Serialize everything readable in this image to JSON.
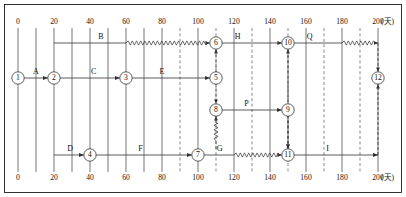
{
  "diagram": {
    "unit_label": "(天)",
    "axis": {
      "min": 0,
      "max": 200,
      "major_step": 20,
      "minor_step": 10,
      "major_ticks": [
        0,
        20,
        40,
        60,
        80,
        100,
        120,
        140,
        160,
        180,
        200
      ],
      "minor_dashed_ticks": [
        90,
        110,
        130,
        150,
        170,
        190
      ],
      "minor_solid_ticks": [
        10,
        30,
        50,
        70
      ],
      "top_tick_labels": [
        "0",
        "20",
        "40",
        "60",
        "80",
        "100",
        "120",
        "140",
        "160",
        "180",
        "200"
      ],
      "bottom_tick_labels": [
        "0",
        "20",
        "40",
        "60",
        "80",
        "100",
        "120",
        "140",
        "160",
        "180",
        "200"
      ]
    },
    "rows": {
      "r1": 43,
      "r2": 78,
      "r3": 110,
      "r4": 155
    },
    "nodes": [
      {
        "id": "1",
        "label": "1",
        "day": 0,
        "row": "r2"
      },
      {
        "id": "2",
        "label": "2",
        "day": 20,
        "row": "r2"
      },
      {
        "id": "3",
        "label": "3",
        "day": 60,
        "row": "r2"
      },
      {
        "id": "4",
        "label": "4",
        "day": 40,
        "row": "r4"
      },
      {
        "id": "5",
        "label": "5",
        "day": 110,
        "row": "r2"
      },
      {
        "id": "6",
        "label": "6",
        "day": 110,
        "row": "r1"
      },
      {
        "id": "7",
        "label": "7",
        "day": 100,
        "row": "r4"
      },
      {
        "id": "8",
        "label": "8",
        "day": 110,
        "row": "r3"
      },
      {
        "id": "9",
        "label": "9",
        "day": 150,
        "row": "r3"
      },
      {
        "id": "10",
        "label": "10",
        "day": 150,
        "row": "r1"
      },
      {
        "id": "11",
        "label": "11",
        "day": 150,
        "row": "r4"
      },
      {
        "id": "12",
        "label": "12",
        "day": 200,
        "row": "r2"
      }
    ],
    "activities": [
      {
        "name": "A",
        "from": "1",
        "to": "2",
        "row": "r2",
        "start": 0,
        "end": 20,
        "duration": 20,
        "float": 0,
        "label_day": 10
      },
      {
        "name": "B",
        "from": "2",
        "to": "6",
        "row": "r1",
        "start": 20,
        "end": 110,
        "duration": 40,
        "float": 50,
        "label_day": 46
      },
      {
        "name": "C",
        "from": "2",
        "to": "3",
        "row": "r2",
        "start": 20,
        "end": 60,
        "duration": 40,
        "float": 0,
        "label_day": 42
      },
      {
        "name": "D",
        "from": "2",
        "to": "4",
        "row": "r4",
        "start": 20,
        "end": 40,
        "duration": 20,
        "float": 0,
        "label_day": 29
      },
      {
        "name": "E",
        "from": "3",
        "to": "5",
        "row": "r2",
        "start": 60,
        "end": 110,
        "duration": 50,
        "float": 0,
        "label_day": 80
      },
      {
        "name": "F",
        "from": "4",
        "to": "7",
        "row": "r4",
        "start": 40,
        "end": 100,
        "duration": 60,
        "float": 0,
        "label_day": 68
      },
      {
        "name": "G",
        "from": "7",
        "to": "11",
        "row": "r4",
        "start": 100,
        "end": 150,
        "duration": 20,
        "float": 30,
        "label_day": 112
      },
      {
        "name": "H",
        "from": "6",
        "to": "10",
        "row": "r1",
        "start": 110,
        "end": 150,
        "duration": 35,
        "float": 5,
        "label_day": 122
      },
      {
        "name": "P",
        "from": "8",
        "to": "9",
        "row": "r3",
        "start": 110,
        "end": 150,
        "duration": 40,
        "float": 0,
        "label_day": 127
      },
      {
        "name": "Q",
        "from": "10",
        "to": "12",
        "row": "r1",
        "start": 150,
        "end": 200,
        "duration": 30,
        "float": 20,
        "label_day": 162
      },
      {
        "name": "I",
        "from": "11",
        "to": "12",
        "row": "r4",
        "start": 150,
        "end": 200,
        "duration": 50,
        "float": 0,
        "label_day": 172
      }
    ],
    "dummies": [
      {
        "from": "5",
        "to": "6",
        "day": 110,
        "kind": "vertical-up"
      },
      {
        "from": "5",
        "to": "8",
        "day": 110,
        "kind": "vertical-down"
      },
      {
        "from": "7",
        "to": "8",
        "day": 110,
        "kind": "vertical-up-wavy"
      },
      {
        "from": "10",
        "to": "11",
        "day": 150,
        "kind": "vertical-down"
      },
      {
        "from": "11",
        "to": "10",
        "day": 150,
        "kind": "vertical-up"
      },
      {
        "from": "9",
        "to": "11",
        "day": 150,
        "kind": "vertical-down"
      },
      {
        "from": "12",
        "to": "ends",
        "day": 200,
        "kind": "vertical-both"
      }
    ]
  }
}
